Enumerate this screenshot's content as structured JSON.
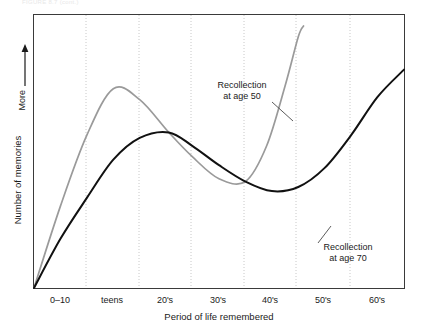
{
  "figure": {
    "top_faint_caption": "FIGURE 8.7 (cont.)",
    "background_color": "#ffffff"
  },
  "chart_data": {
    "type": "line",
    "title": "",
    "xlabel": "Period of life remembered",
    "ylabel": "Number of memories",
    "y_direction_label": "More",
    "grid": true,
    "grid_style": "dotted-vertical",
    "legend": "inline-annotations",
    "axis_color": "#3a3a3a",
    "grid_color": "#cfcfcf",
    "categories": [
      "0–10",
      "teens",
      "20's",
      "30's",
      "40's",
      "50's",
      "60's"
    ],
    "xlim": [
      0,
      7
    ],
    "ylim": [
      0,
      1
    ],
    "series": [
      {
        "name": "Recollection at age 50",
        "color": "#9a9a9a",
        "label": "Recollection",
        "label_line2": "at age 50",
        "x": [
          0.0,
          0.5,
          1.0,
          1.5,
          2.0,
          2.55,
          3.0,
          3.5,
          4.0,
          4.4,
          4.75,
          5.0,
          5.1
        ],
        "values": [
          0.0,
          0.3,
          0.56,
          0.73,
          0.69,
          0.57,
          0.48,
          0.4,
          0.39,
          0.52,
          0.74,
          0.92,
          0.96
        ]
      },
      {
        "name": "Recollection at age 70",
        "color": "#111111",
        "label": "Recollection",
        "label_line2": "at age 70",
        "x": [
          0.0,
          0.5,
          1.0,
          1.5,
          2.0,
          2.55,
          3.0,
          3.5,
          4.0,
          4.5,
          5.0,
          5.5,
          6.0,
          6.5,
          7.0
        ],
        "values": [
          0.0,
          0.18,
          0.33,
          0.47,
          0.55,
          0.57,
          0.52,
          0.45,
          0.39,
          0.355,
          0.37,
          0.44,
          0.56,
          0.7,
          0.8
        ]
      }
    ]
  }
}
